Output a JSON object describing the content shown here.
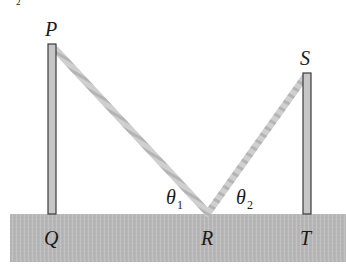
{
  "diagram": {
    "fragment_top_left": "2",
    "points": {
      "P": "P",
      "Q": "Q",
      "R": "R",
      "S": "S",
      "T": "T"
    },
    "angles": {
      "theta1": {
        "symbol": "θ",
        "subscript": "1"
      },
      "theta2": {
        "symbol": "θ",
        "subscript": "2"
      }
    },
    "colors": {
      "ground": "#b8b8b8",
      "pole_fill": "#c4c4c4",
      "pole_stroke": "#3a3a3a",
      "rope": "#c8c8c8",
      "text": "#1a1a1a"
    }
  }
}
